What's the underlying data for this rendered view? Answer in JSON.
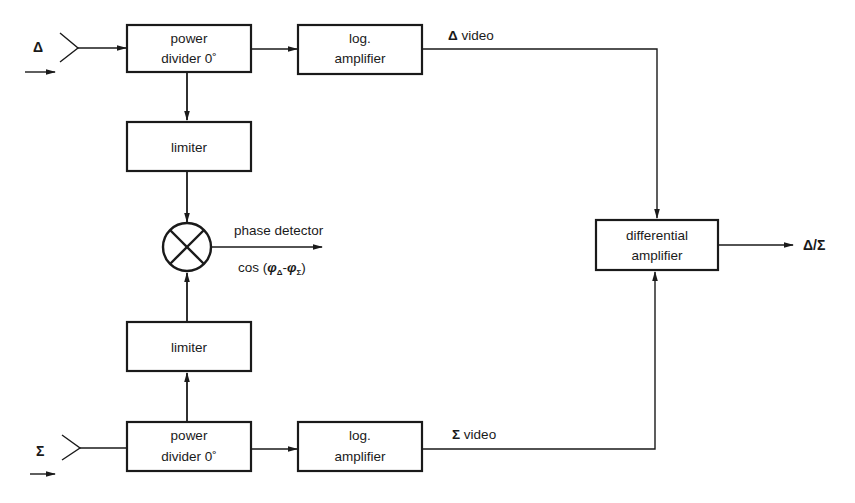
{
  "diagram": {
    "inputs": {
      "delta": {
        "symbol": "Δ"
      },
      "sigma": {
        "symbol": "Σ"
      }
    },
    "blocks": {
      "power_divider_top": {
        "line1": "power",
        "line2": "divider 0˚"
      },
      "log_amp_top": {
        "line1": "log.",
        "line2": "amplifier"
      },
      "limiter_top": {
        "label": "limiter"
      },
      "limiter_bottom": {
        "label": "limiter"
      },
      "power_divider_bottom": {
        "line1": "power",
        "line2": "divider 0˚"
      },
      "log_amp_bottom": {
        "line1": "log.",
        "line2": "amplifier"
      },
      "differential_amp": {
        "line1": "differential",
        "line2": "amplifier"
      }
    },
    "signals": {
      "delta_video": {
        "symbol": "Δ",
        "text": " video"
      },
      "sigma_video": {
        "symbol": "Σ",
        "text": " video"
      },
      "phase_detector": "phase detector",
      "phase_formula": {
        "prefix": "cos (",
        "phi1": "φ",
        "sub1": "Δ",
        "dash": "-",
        "phi2": "φ",
        "sub2": "Σ",
        "suffix": ")"
      },
      "output": "Δ/Σ"
    }
  }
}
